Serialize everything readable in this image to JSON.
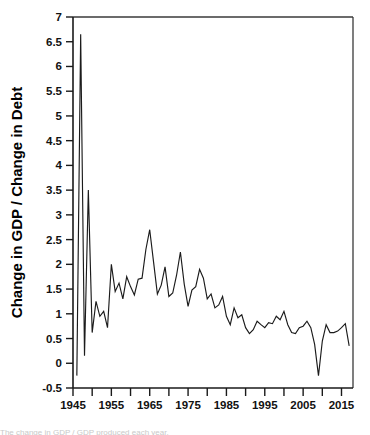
{
  "chart_data": {
    "type": "line",
    "title": "",
    "xlabel": "",
    "ylabel": "Change in GDP / Change in Debt",
    "xlim": [
      1945,
      2018
    ],
    "ylim": [
      -0.5,
      7
    ],
    "grid": false,
    "legend": "none",
    "y_ticks": [
      -0.5,
      0,
      0.5,
      1,
      1.5,
      2,
      2.5,
      3,
      3.5,
      4,
      4.5,
      5,
      5.5,
      6,
      6.5,
      7
    ],
    "y_tick_labels": [
      "-0.5",
      "0",
      "0.5",
      "1",
      "1.5",
      "2",
      "2.5",
      "3",
      "3.5",
      "4",
      "4.5",
      "5",
      "5.5",
      "6",
      "6.5",
      "7"
    ],
    "x_ticks": [
      1945,
      1950,
      1955,
      1960,
      1965,
      1970,
      1975,
      1980,
      1985,
      1990,
      1995,
      2000,
      2005,
      2010,
      2015
    ],
    "x_tick_labels": [
      "1945",
      "",
      "1955",
      "",
      "1965",
      "",
      "1975",
      "",
      "1985",
      "",
      "1995",
      "",
      "2005",
      "",
      "2015"
    ],
    "x_labeled_ticks": [
      1945,
      1955,
      1965,
      1975,
      1985,
      1995,
      2005,
      2015
    ],
    "series": [
      {
        "name": "Change in GDP / Change in Debt",
        "color": "#1b1b1b",
        "x": [
          1946,
          1947,
          1948,
          1949,
          1950,
          1951,
          1952,
          1953,
          1954,
          1955,
          1956,
          1957,
          1958,
          1959,
          1960,
          1961,
          1962,
          1963,
          1964,
          1965,
          1966,
          1967,
          1968,
          1969,
          1970,
          1971,
          1972,
          1973,
          1974,
          1975,
          1976,
          1977,
          1978,
          1979,
          1980,
          1981,
          1982,
          1983,
          1984,
          1985,
          1986,
          1987,
          1988,
          1989,
          1990,
          1991,
          1992,
          1993,
          1994,
          1995,
          1996,
          1997,
          1998,
          1999,
          2000,
          2001,
          2002,
          2003,
          2004,
          2005,
          2006,
          2007,
          2008,
          2009,
          2010,
          2011,
          2012,
          2013,
          2014,
          2015,
          2016,
          2017
        ],
        "values": [
          -0.25,
          6.65,
          0.15,
          3.5,
          0.62,
          1.25,
          0.95,
          1.05,
          0.72,
          2.0,
          1.45,
          1.62,
          1.3,
          1.75,
          1.55,
          1.38,
          1.7,
          1.72,
          2.3,
          2.7,
          2.05,
          1.4,
          1.58,
          1.95,
          1.35,
          1.42,
          1.78,
          2.25,
          1.6,
          1.15,
          1.48,
          1.55,
          1.9,
          1.72,
          1.3,
          1.4,
          1.12,
          1.18,
          1.35,
          0.95,
          0.78,
          1.12,
          0.92,
          0.98,
          0.72,
          0.6,
          0.68,
          0.85,
          0.78,
          0.72,
          0.82,
          0.8,
          0.95,
          0.88,
          1.05,
          0.78,
          0.62,
          0.6,
          0.72,
          0.75,
          0.85,
          0.72,
          0.38,
          -0.25,
          0.45,
          0.78,
          0.62,
          0.62,
          0.65,
          0.72,
          0.8,
          0.35
        ]
      }
    ]
  },
  "caption": {
    "text": "The change in GDP / GDP produced each year."
  }
}
